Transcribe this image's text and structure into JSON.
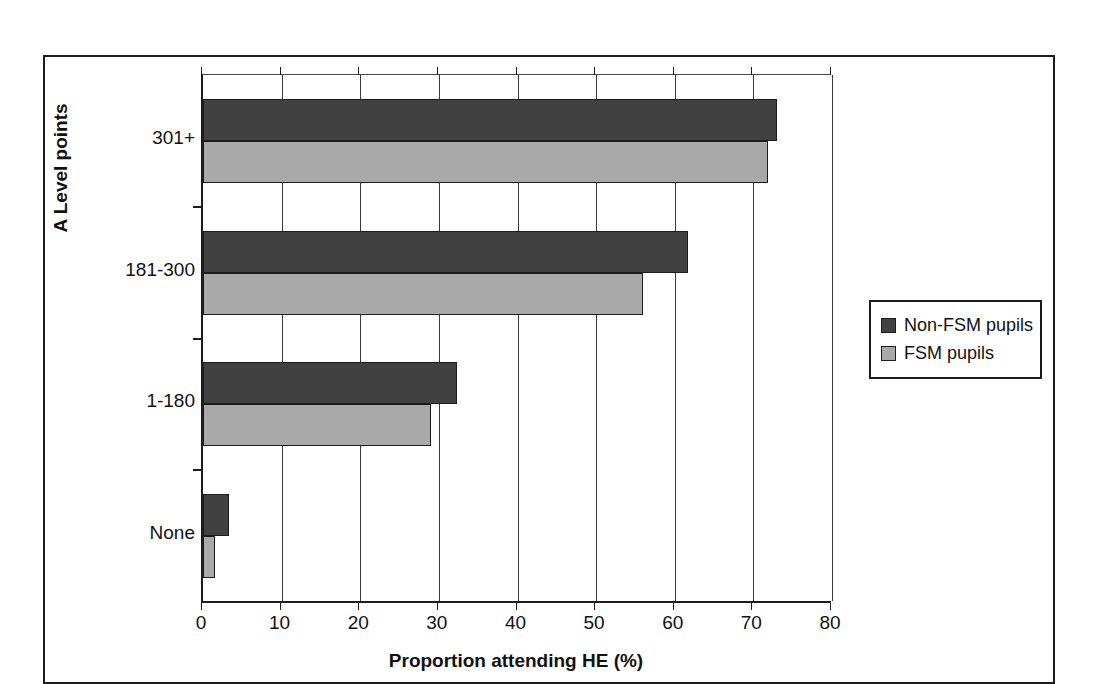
{
  "chart_data": {
    "type": "bar",
    "orientation": "horizontal",
    "title": "",
    "xlabel": "Proportion attending HE (%)",
    "ylabel": "A Level points",
    "categories": [
      "None",
      "1-180",
      "181-300",
      "301+"
    ],
    "series": [
      {
        "name": "Non-FSM pupils",
        "color": "#414141",
        "values": [
          3.3,
          32.3,
          61.7,
          73.0
        ]
      },
      {
        "name": "FSM pupils",
        "color": "#a9a9a9",
        "values": [
          1.5,
          29.0,
          56.0,
          71.8
        ]
      }
    ],
    "xlim": [
      0,
      80
    ],
    "xticks": [
      0,
      10,
      20,
      30,
      40,
      50,
      60,
      70,
      80
    ],
    "xtick_labels": [
      "0",
      "10",
      "20",
      "30",
      "40",
      "50",
      "60",
      "70",
      "80"
    ],
    "grid": "vertical",
    "legend_position": "right"
  },
  "legend": {
    "entries": [
      {
        "label": "Non-FSM pupils",
        "swatch": "dark"
      },
      {
        "label": "FSM pupils",
        "swatch": "light"
      }
    ]
  }
}
